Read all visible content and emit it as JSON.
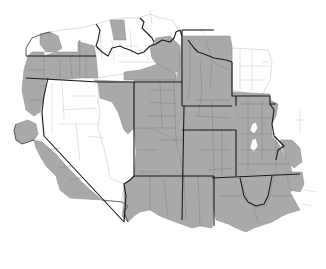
{
  "map": {
    "title": "",
    "description": "County-level choropleth of the western United States; shaded counties in gray, unshaded in white",
    "colors": {
      "shaded": "#a9a9a9",
      "unshaded": "#ffffff",
      "state_border": "#1a1a1a",
      "county_border": "#7e7e7e"
    },
    "legend": [],
    "regions": [
      {
        "name": "Washington",
        "status": "partially shaded"
      },
      {
        "name": "Oregon",
        "status": "partially shaded (west and north-east)"
      },
      {
        "name": "California",
        "status": "shaded coastal and southern counties"
      },
      {
        "name": "Nevada",
        "status": "mostly unshaded"
      },
      {
        "name": "Idaho",
        "status": "partially shaded"
      },
      {
        "name": "Montana",
        "status": "mostly unshaded, east shaded"
      },
      {
        "name": "Utah",
        "status": "shaded"
      },
      {
        "name": "Wyoming",
        "status": "shaded"
      },
      {
        "name": "Colorado",
        "status": "shaded"
      },
      {
        "name": "Arizona",
        "status": "shaded"
      },
      {
        "name": "New Mexico",
        "status": "shaded"
      },
      {
        "name": "North Dakota",
        "status": "shaded west, unshaded east"
      },
      {
        "name": "South Dakota",
        "status": "shaded"
      },
      {
        "name": "Nebraska",
        "status": "shaded"
      },
      {
        "name": "Kansas",
        "status": "shaded"
      },
      {
        "name": "Oklahoma",
        "status": "shaded"
      },
      {
        "name": "Texas",
        "status": "shaded (panhandle)"
      }
    ]
  }
}
